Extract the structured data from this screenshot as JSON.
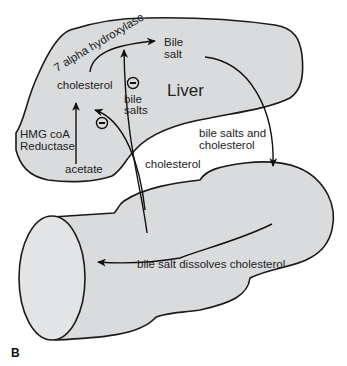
{
  "figure": {
    "panel_label": "B",
    "colors": {
      "organ_fill": "#d9dbdd",
      "outline": "#1a1a1a",
      "text": "#222222",
      "background": "#ffffff"
    },
    "organs": {
      "liver": {
        "label": "Liver"
      },
      "intestine": {
        "label": ""
      }
    },
    "liver_labels": {
      "enzyme_top": "7 alpha hydroxylase",
      "bile_salt_line1": "Bile",
      "bile_salt_line2": "salt",
      "cholesterol": "cholesterol",
      "bile_salts_line1": "bile",
      "bile_salts_line2": "salts",
      "enzyme_left_line1": "HMG coA",
      "enzyme_left_line2": "Reductase",
      "acetate": "acetate"
    },
    "transport_labels": {
      "bile_salts_and_line1": "bile salts and",
      "bile_salts_and_line2": "cholesterol",
      "cholesterol_return": "cholesterol"
    },
    "intestine_labels": {
      "dissolve": "bile salt dissolves cholesterol"
    },
    "inhibitors": [
      {
        "symbol": "−",
        "target": "7 alpha hydroxylase",
        "by": "bile salts"
      },
      {
        "symbol": "−",
        "target": "HMG coA Reductase",
        "by": "cholesterol"
      }
    ],
    "pathway": [
      {
        "from": "acetate",
        "to": "cholesterol",
        "enzyme": "HMG coA Reductase"
      },
      {
        "from": "cholesterol",
        "to": "Bile salt",
        "enzyme": "7 alpha hydroxylase"
      },
      {
        "from": "Bile salt",
        "to": "intestine",
        "label": "bile salts and cholesterol"
      },
      {
        "from": "intestine",
        "to": "liver",
        "label": "bile salts"
      },
      {
        "from": "intestine",
        "to": "liver",
        "label": "cholesterol"
      },
      {
        "from": "intestine right",
        "to": "intestine lumen",
        "label": "bile salt dissolves cholesterol"
      }
    ]
  }
}
